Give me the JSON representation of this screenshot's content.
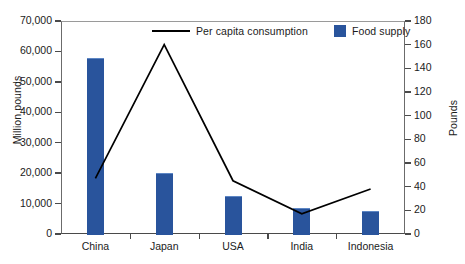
{
  "chart_data": {
    "type": "bar",
    "title": "",
    "subtitle": "",
    "categories": [
      "China",
      "Japan",
      "USA",
      "India",
      "Indonesia"
    ],
    "xlabel": "",
    "grid": false,
    "legend_position": "top-center",
    "series": [
      {
        "name": "Food supply",
        "type": "bar",
        "axis": "left",
        "unit": "Million pounds",
        "values": [
          58000,
          20200,
          12500,
          8500,
          7500
        ]
      },
      {
        "name": "Per capita consumption",
        "type": "line",
        "axis": "right",
        "unit": "Pounds",
        "values": [
          47,
          160,
          45,
          17,
          38
        ]
      }
    ],
    "left_axis": {
      "label": "Million pounds",
      "ylim": [
        0,
        70000
      ],
      "tick_values": [
        0,
        10000,
        20000,
        30000,
        40000,
        50000,
        60000,
        70000
      ],
      "tick_labels": [
        "0",
        "10,000",
        "20,000",
        "30,000",
        "40,000",
        "50,000",
        "60,000",
        "70,000"
      ]
    },
    "right_axis": {
      "label": "Pounds",
      "ylim": [
        0,
        180
      ],
      "tick_values": [
        0,
        20,
        40,
        60,
        80,
        100,
        120,
        140,
        160,
        180
      ],
      "tick_labels": [
        "0",
        "20",
        "40",
        "60",
        "80",
        "100",
        "120",
        "140",
        "160",
        "180"
      ]
    },
    "colors": {
      "bar": "#29549C",
      "line": "#000000",
      "axis": "#4a4a4a",
      "text": "#1b1b1b",
      "background": "#ffffff"
    }
  },
  "legend": {
    "line_entry_label": "Per capita consumption",
    "bar_entry_label": "Food supply"
  },
  "axes": {
    "left_title": "Million pounds",
    "right_title": "Pounds"
  }
}
